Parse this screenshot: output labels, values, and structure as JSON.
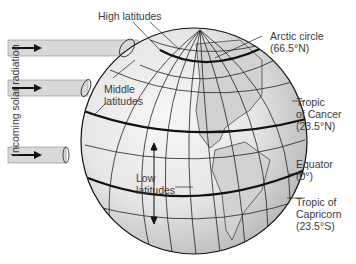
{
  "figure": {
    "side_label": "Incoming solar radiation",
    "labels": {
      "high_latitudes": "High latitudes",
      "middle_latitudes_1": "Middle",
      "middle_latitudes_2": "latitudes",
      "low_latitudes_1": "Low",
      "low_latitudes_2": "latitudes",
      "arctic_circle_1": "Arctic circle",
      "arctic_circle_2": "(66.5°N)",
      "tropic_cancer_1": "Tropic",
      "tropic_cancer_2": "of Cancer",
      "tropic_cancer_3": "(23.5°N)",
      "equator_1": "Equator",
      "equator_2": "(0°)",
      "tropic_capricorn_1": "Tropic of",
      "tropic_capricorn_2": "Capricorn",
      "tropic_capricorn_3": "(23.5°S)"
    },
    "colors": {
      "globe_light": "#f2f2f2",
      "globe_dark": "#b9b9b9",
      "land": "#d4d4d4",
      "beam": "#d9d9d9",
      "line": "#1a1a1a"
    }
  }
}
